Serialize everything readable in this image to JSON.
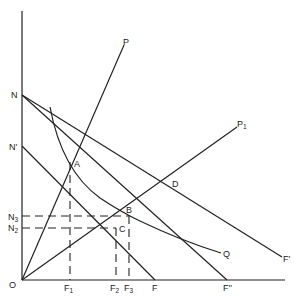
{
  "diagram": {
    "axes": {
      "origin_label": "O",
      "y_axis_labels": [
        "N",
        "N'",
        "N3",
        "N2"
      ],
      "x_axis_labels": [
        "F1",
        "F2",
        "F3",
        "F",
        "F''"
      ]
    },
    "points": {
      "A": "A",
      "B": "B",
      "C": "C",
      "D": "D"
    },
    "rays": {
      "P": "P",
      "P1": "P1"
    },
    "lines": {
      "F_prime": "F'",
      "F_double_prime": "F''",
      "F": "F"
    },
    "curve": {
      "Q": "Q"
    },
    "labels": {
      "O": "O",
      "N": "N",
      "N_prime": "N'",
      "N3_main": "N",
      "N3_sub": "3",
      "N2_main": "N",
      "N2_sub": "2",
      "F1_main": "F",
      "F1_sub": "1",
      "F2_main": "F",
      "F2_sub": "2",
      "F3_main": "F",
      "F3_sub": "3",
      "F": "F",
      "F_double_prime": "F''",
      "F_prime": "F'",
      "P": "P",
      "P1_main": "P",
      "P1_sub": "1",
      "Q": "Q",
      "A": "A",
      "B": "B",
      "C": "C",
      "D": "D"
    }
  }
}
